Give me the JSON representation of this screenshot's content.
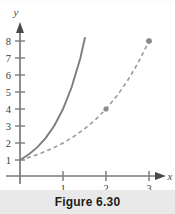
{
  "caption": {
    "text": "Figure 6.30"
  },
  "chart_data": {
    "type": "line",
    "title": "",
    "subtitle": "",
    "xlabel": "x",
    "ylabel": "y",
    "xlim": [
      0,
      3.4
    ],
    "ylim": [
      0,
      8.6
    ],
    "grid": false,
    "legend": "none",
    "x_ticks": [
      1,
      2,
      3
    ],
    "x_tick_labels": [
      "1",
      "2",
      "3"
    ],
    "y_ticks": [
      1,
      2,
      3,
      4,
      5,
      6,
      7,
      8
    ],
    "y_tick_labels": [
      "1",
      "2",
      "3",
      "4",
      "5",
      "6",
      "7",
      "8"
    ],
    "axis_arrows": true,
    "series": [
      {
        "name": "solid-curve",
        "style": "solid",
        "color": "#7d7d7d",
        "x": [
          0,
          0.2,
          0.4,
          0.6,
          0.8,
          1.0,
          1.2,
          1.4,
          1.6,
          1.8,
          2.0
        ],
        "values": [
          1.0,
          1.32,
          1.74,
          2.3,
          3.03,
          4.0,
          5.28,
          6.96,
          9.19,
          12.13,
          16.0
        ],
        "y_at_x": {
          "0": 1,
          "1": 4,
          "2": 16
        },
        "clipped_at_y": 8.2,
        "markers": []
      },
      {
        "name": "dashed-curve",
        "style": "dashed",
        "color": "#9a9a9a",
        "x": [
          0,
          0.25,
          0.5,
          0.75,
          1.0,
          1.25,
          1.5,
          1.75,
          2.0,
          2.25,
          2.5,
          2.75,
          3.0
        ],
        "values": [
          1.0,
          1.19,
          1.41,
          1.68,
          2.0,
          2.38,
          2.83,
          3.36,
          4.0,
          4.76,
          5.66,
          6.73,
          8.0
        ],
        "y_at_x": {
          "0": 1,
          "1": 2,
          "2": 4,
          "3": 8
        },
        "markers": [
          {
            "x": 1,
            "y": 2
          },
          {
            "x": 2,
            "y": 4
          },
          {
            "x": 3,
            "y": 8
          }
        ]
      }
    ]
  },
  "colors": {
    "axis": "#7a7a7a",
    "solid_curve": "#7d7d7d",
    "dashed_curve": "#9a9a9a",
    "marker": "#8a8a8a",
    "caption_band": "#e9e9e9",
    "caption_text": "#1c1c1c",
    "background": "#ffffff"
  }
}
